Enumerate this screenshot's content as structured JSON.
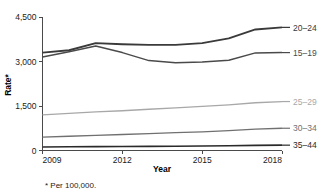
{
  "chart_data": {
    "type": "line",
    "title": "",
    "xlabel": "Year",
    "ylabel": "Rate*",
    "footnote": "* Per 100,000.",
    "x": [
      2009,
      2010,
      2011,
      2012,
      2013,
      2014,
      2015,
      2016,
      2017,
      2018
    ],
    "xtick_labels": [
      "2009",
      "2012",
      "2015",
      "2018"
    ],
    "xticks": [
      2009,
      2012,
      2015,
      2018
    ],
    "xlim": [
      2009,
      2018
    ],
    "ytick_labels": [
      "0",
      "1,500",
      "3,000",
      "4,500"
    ],
    "yticks": [
      0,
      1500,
      3000,
      4500
    ],
    "ylim": [
      0,
      4500
    ],
    "grid": false,
    "legend_position": "right-of-plot-end-labels",
    "series": [
      {
        "name": "20–24",
        "label": "20–24",
        "color": "#3a3a3a",
        "width": 1.9,
        "values": [
          3300,
          3380,
          3620,
          3580,
          3560,
          3560,
          3620,
          3780,
          4080,
          4150
        ]
      },
      {
        "name": "15–19",
        "label": "15–19",
        "color": "#4a4a4a",
        "width": 1.5,
        "values": [
          3150,
          3330,
          3520,
          3300,
          3030,
          2955,
          2980,
          3040,
          3290,
          3300
        ]
      },
      {
        "name": "25–29",
        "label": "25–29",
        "color": "#a8a8a8",
        "width": 1.3,
        "values": [
          1200,
          1250,
          1300,
          1340,
          1390,
          1440,
          1490,
          1540,
          1610,
          1650
        ]
      },
      {
        "name": "30–34",
        "label": "30–34",
        "color": "#707070",
        "width": 1.3,
        "values": [
          450,
          480,
          510,
          540,
          570,
          600,
          630,
          670,
          720,
          750
        ]
      },
      {
        "name": "35–44",
        "label": "35–44",
        "color": "#2a2a2a",
        "width": 1.6,
        "values": [
          120,
          125,
          130,
          135,
          140,
          145,
          152,
          160,
          172,
          180
        ]
      }
    ]
  },
  "axis": {
    "y_title": "Rate*",
    "x_title": "Year"
  },
  "footnote": {
    "text": "* Per 100,000."
  }
}
